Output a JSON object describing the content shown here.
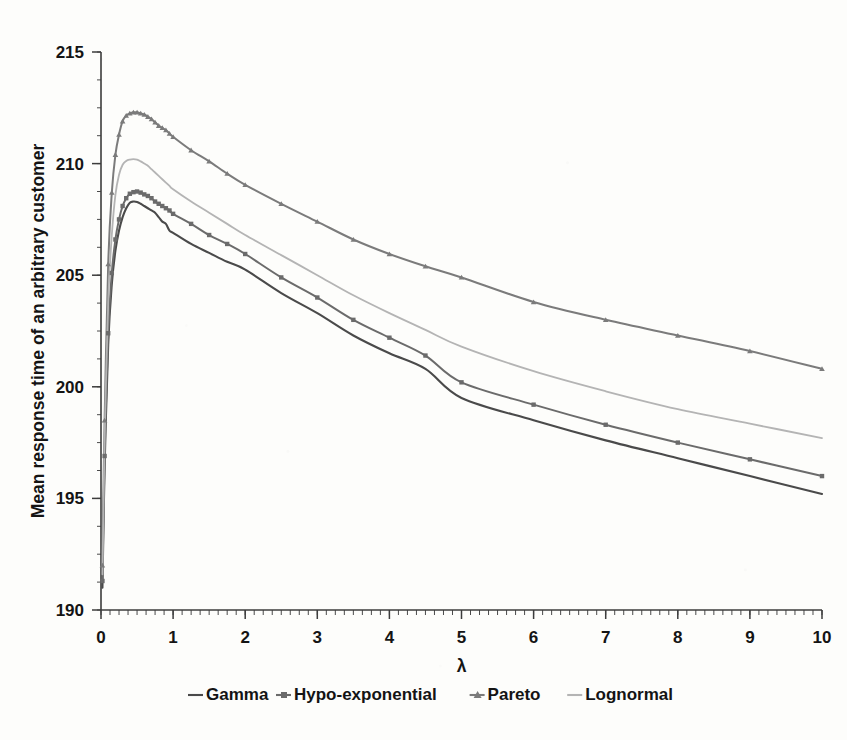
{
  "chart_data": {
    "type": "line",
    "title": "",
    "xlabel": "λ",
    "ylabel": "Mean response time of an arbitrary customer",
    "xlim": [
      0,
      10
    ],
    "ylim": [
      190,
      215
    ],
    "xticks": [
      0,
      1,
      2,
      3,
      4,
      5,
      6,
      7,
      8,
      9,
      10
    ],
    "yticks": [
      190,
      195,
      200,
      205,
      210,
      215
    ],
    "xtick_labels": [
      "0",
      "1",
      "2",
      "3",
      "4",
      "5",
      "6",
      "7",
      "8",
      "9",
      "10"
    ],
    "ytick_labels": [
      "190",
      "195",
      "200",
      "205",
      "210",
      "215"
    ],
    "grid": false,
    "legend_position": "bottom",
    "minor_ticks": {
      "x_step": 0.125,
      "y_step": 1.25
    },
    "x": [
      0.02,
      0.05,
      0.1,
      0.15,
      0.2,
      0.25,
      0.3,
      0.35,
      0.4,
      0.45,
      0.5,
      0.55,
      0.6,
      0.65,
      0.7,
      0.75,
      0.8,
      0.85,
      0.9,
      0.95,
      1.0,
      1.25,
      1.5,
      1.75,
      2.0,
      2.5,
      3.0,
      3.5,
      4.0,
      4.5,
      5.0,
      6.0,
      7.0,
      8.0,
      9.0,
      10.0
    ],
    "series": [
      {
        "name": "Gamma",
        "color": "#4a4a4a",
        "marker": "none",
        "peak_x": 0.45,
        "peak_y": 208.3,
        "end_y": 195.2,
        "values": [
          191.0,
          196.4,
          201.9,
          204.6,
          206.1,
          207.0,
          207.6,
          208.0,
          208.25,
          208.3,
          208.28,
          208.2,
          208.1,
          208.0,
          207.9,
          207.8,
          207.6,
          207.4,
          207.3,
          207.0,
          206.9,
          206.4,
          206.0,
          205.6,
          205.25,
          204.2,
          203.3,
          202.3,
          201.5,
          200.8,
          199.5,
          198.5,
          197.6,
          196.8,
          196.0,
          195.2
        ]
      },
      {
        "name": "Hypo-exponential",
        "color": "#6b6b6b",
        "marker": "square",
        "peak_x": 0.5,
        "peak_y": 208.75,
        "end_y": 196.0,
        "values": [
          191.3,
          196.9,
          202.4,
          205.1,
          206.6,
          207.5,
          208.1,
          208.45,
          208.65,
          208.72,
          208.75,
          208.7,
          208.62,
          208.55,
          208.45,
          208.3,
          208.2,
          208.1,
          208.0,
          207.9,
          207.75,
          207.3,
          206.8,
          206.4,
          205.95,
          204.9,
          204.0,
          203.0,
          202.2,
          201.4,
          200.2,
          199.2,
          198.3,
          197.5,
          196.75,
          196.0
        ]
      },
      {
        "name": "Pareto",
        "color": "#7b7b7b",
        "marker": "triangle",
        "peak_x": 0.52,
        "peak_y": 212.3,
        "end_y": 200.8,
        "values": [
          192.0,
          198.5,
          205.5,
          208.7,
          210.4,
          211.3,
          211.9,
          212.15,
          212.25,
          212.3,
          212.3,
          212.25,
          212.2,
          212.1,
          212.0,
          211.85,
          211.7,
          211.6,
          211.5,
          211.35,
          211.2,
          210.6,
          210.1,
          209.55,
          209.05,
          208.2,
          207.4,
          206.6,
          205.95,
          205.4,
          204.9,
          203.8,
          203.0,
          202.3,
          201.6,
          200.8
        ]
      },
      {
        "name": "Lognormal",
        "color": "#b4b4b4",
        "marker": "none",
        "peak_x": 0.48,
        "peak_y": 210.2,
        "end_y": 197.7,
        "values": [
          191.6,
          197.6,
          203.8,
          206.8,
          208.6,
          209.5,
          209.95,
          210.12,
          210.18,
          210.2,
          210.18,
          210.1,
          210.0,
          209.9,
          209.75,
          209.6,
          209.45,
          209.3,
          209.15,
          209.0,
          208.85,
          208.3,
          207.8,
          207.3,
          206.8,
          205.9,
          205.0,
          204.1,
          203.3,
          202.55,
          201.8,
          200.7,
          199.8,
          199.0,
          198.35,
          197.7
        ]
      }
    ]
  },
  "legend": {
    "entries": [
      {
        "label": "Gamma",
        "color": "#4a4a4a",
        "marker": "none"
      },
      {
        "label": "Hypo-exponential",
        "color": "#6b6b6b",
        "marker": "square"
      },
      {
        "label": "Pareto",
        "color": "#7b7b7b",
        "marker": "triangle"
      },
      {
        "label": "Lognormal",
        "color": "#b4b4b4",
        "marker": "none"
      }
    ]
  },
  "colors": {
    "background": "#fdfdfb",
    "axis": "#3c3c3c",
    "text": "#141414"
  }
}
